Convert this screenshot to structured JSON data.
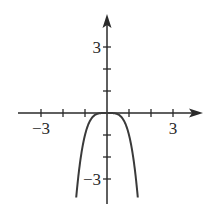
{
  "chart_data": {
    "type": "line",
    "title": "",
    "xlabel": "",
    "ylabel": "",
    "function": "y = -x^4",
    "xlim": [
      -4,
      4.3
    ],
    "ylim": [
      -4.1,
      4.3
    ],
    "grid": false,
    "legend": null,
    "x_ticks": [
      -4,
      -3,
      -2,
      -1,
      1,
      2,
      3
    ],
    "y_ticks": [
      -3,
      -2,
      -1,
      1,
      2,
      3
    ],
    "x_tick_labels": [
      {
        "value": -3,
        "label": "−3"
      },
      {
        "value": 3,
        "label": "3"
      }
    ],
    "y_tick_labels": [
      {
        "value": 3,
        "label": "3"
      },
      {
        "value": -3,
        "label": "−3"
      }
    ],
    "series": [
      {
        "name": "curve",
        "x": [
          -1.4,
          -1.36,
          -1.3,
          -1.2,
          -1.1,
          -1.0,
          -0.9,
          -0.8,
          -0.6,
          -0.4,
          -0.2,
          0,
          0.2,
          0.4,
          0.6,
          0.8,
          0.9,
          1.0,
          1.1,
          1.2,
          1.3,
          1.36,
          1.4
        ],
        "y": [
          -3.84,
          -3.42,
          -2.86,
          -2.07,
          -1.46,
          -1.0,
          -0.66,
          -0.41,
          -0.13,
          -0.03,
          0.0,
          0,
          0.0,
          -0.03,
          -0.13,
          -0.41,
          -0.66,
          -1.0,
          -1.46,
          -2.07,
          -2.86,
          -3.42,
          -3.84
        ]
      }
    ],
    "colors": {
      "axis": "#2a2a2a",
      "curve": "#3a3a3a"
    }
  }
}
